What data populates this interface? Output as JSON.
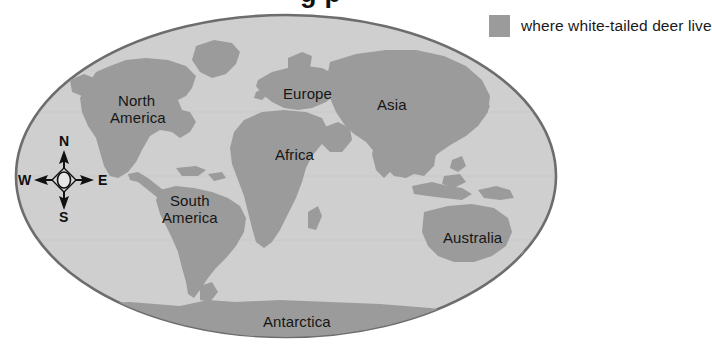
{
  "figure": {
    "title_visible_fragment": "g    p",
    "projection": "oval world map"
  },
  "legend": {
    "swatch_color": "#9b9b9b",
    "label": "where white-tailed deer live"
  },
  "colors": {
    "ocean": "#cfcfcf",
    "land": "#9b9b9b",
    "map_border": "#6d6d6d",
    "text": "#161616",
    "background": "#ffffff"
  },
  "map": {
    "labels": [
      {
        "name": "north-america",
        "text_line1": "North",
        "text_line2": "America",
        "x": 118,
        "y": 106
      },
      {
        "name": "south-america",
        "text_line1": "South",
        "text_line2": "America",
        "x": 170,
        "y": 206
      },
      {
        "name": "europe",
        "text_line1": "Europe",
        "text_line2": "",
        "x": 283,
        "y": 96
      },
      {
        "name": "asia",
        "text_line1": "Asia",
        "text_line2": "",
        "x": 377,
        "y": 105
      },
      {
        "name": "africa",
        "text_line1": "Africa",
        "text_line2": "",
        "x": 275,
        "y": 157
      },
      {
        "name": "australia",
        "text_line1": "Australia",
        "text_line2": "",
        "x": 443,
        "y": 238
      },
      {
        "name": "antarctica",
        "text_line1": "Antarctica",
        "text_line2": "",
        "x": 263,
        "y": 324
      }
    ]
  },
  "compass": {
    "north": "N",
    "south": "S",
    "east": "E",
    "west": "W",
    "center_x": 64,
    "center_y": 180
  }
}
